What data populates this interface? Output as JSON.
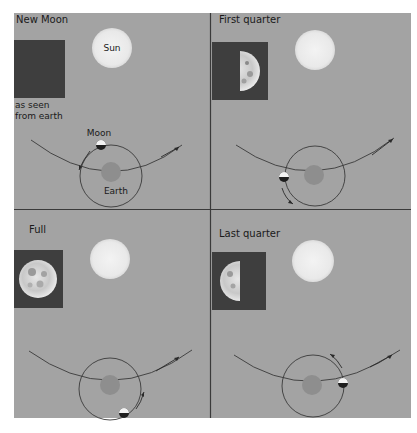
{
  "colors": {
    "page": "#ffffff",
    "panel": "#a3a3a3",
    "divider": "#3a3a3a",
    "dark_square": "#3e3e3e",
    "sun": "#ebebeb",
    "earth": "#8e8e8e",
    "orbit": "#3a3a3a",
    "moon_light": "#f2f2f2",
    "moon_dark": "#1e1e1e"
  },
  "panels": [
    {
      "id": "new-moon",
      "title": "New Moon",
      "sun_label": "Sun",
      "caption_line1": "as seen",
      "caption_line2": "from earth",
      "moon_label": "Moon",
      "earth_label": "Earth",
      "phase": "new"
    },
    {
      "id": "first-quarter",
      "title": "First quarter",
      "phase": "first-quarter"
    },
    {
      "id": "full",
      "title": "Full",
      "phase": "full"
    },
    {
      "id": "last-quarter",
      "title": "Last quarter",
      "phase": "last-quarter"
    }
  ]
}
